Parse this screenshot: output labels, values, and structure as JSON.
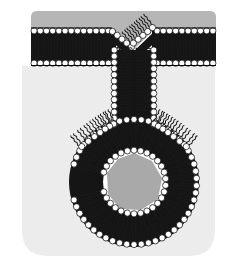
{
  "figure": {
    "type": "scientific-diagram",
    "width": 234,
    "height": 271,
    "background_color": "#ffffff"
  },
  "colors": {
    "extracellular_gray": "#b6b6b6",
    "cytoplasm_gray": "#ececec",
    "vesicle_lumen_gray": "#a9a9a9",
    "lipid_head_fill": "#ffffff",
    "lipid_head_stroke": "#000000",
    "lipid_tail": "#1a1a1a",
    "membrane_core": "#000000",
    "page_background": "#ffffff"
  },
  "regions": {
    "extracellular": {
      "name": "extracellular-space",
      "label": "Extracellular space",
      "fill": "#b6b6b6",
      "x": 31,
      "y": 11,
      "width": 185,
      "height": 17,
      "corner_radius": 6
    },
    "cytoplasm": {
      "name": "cytoplasm",
      "label": "Cytoplasm",
      "fill": "#ececec",
      "x": 22,
      "y": 66,
      "width": 193,
      "height": 190,
      "corner_radius": 26
    },
    "vesicle_lumen": {
      "name": "vesicle-lumen",
      "label": "Vesicle lumen",
      "fill": "#a9a9a9",
      "center_x": 134,
      "center_y": 182,
      "radius": 29
    }
  },
  "membrane": {
    "name": "plasma-membrane",
    "label": "Plasma membrane (lipid bilayer)",
    "flat_left": {
      "x_start": 31,
      "x_end": 116,
      "y_top": 28,
      "y_bottom": 66
    },
    "flat_right": {
      "x_start": 152,
      "x_end": 216,
      "y_top": 28,
      "y_bottom": 66
    },
    "bilayer_thickness": 38,
    "head_radius": 3.1,
    "head_spacing": 6.2,
    "tail_count_per_leaflet": 2,
    "leaflets": [
      "outer-leaflet",
      "inner-leaflet"
    ]
  },
  "dimple": {
    "name": "membrane-dimple",
    "label": "V-shaped invagination pit",
    "apex_x": 134,
    "apex_y": 46,
    "left_x": 116,
    "right_x": 152,
    "top_y": 28
  },
  "neck": {
    "name": "invagination-neck",
    "label": "Invagination neck",
    "left_x": 113,
    "right_x": 155,
    "y_top": 50,
    "y_bottom": 128,
    "channel_width": 20
  },
  "vesicle": {
    "name": "endocytic-vesicle",
    "label": "Forming endocytic vesicle",
    "center_x": 134,
    "center_y": 182,
    "outer_radius": 66,
    "inner_radius": 29,
    "outer_head_count": 54,
    "inner_head_count": 30
  }
}
